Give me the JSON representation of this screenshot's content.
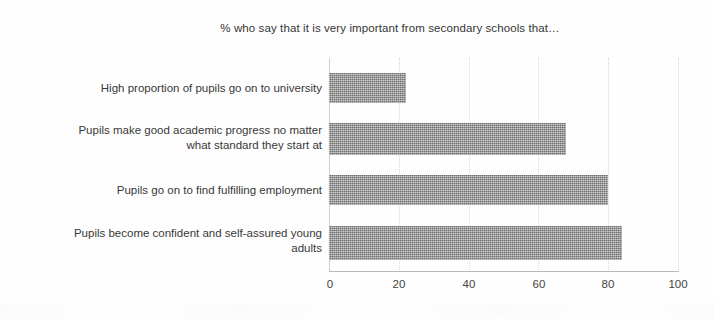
{
  "chart_data": {
    "type": "bar",
    "orientation": "horizontal",
    "title": "% who say that it is very important from secondary schools that…",
    "xlabel": "",
    "ylabel": "",
    "xlim": [
      0,
      100
    ],
    "xticks": [
      0,
      20,
      40,
      60,
      80,
      100
    ],
    "tick_labels": [
      "0",
      "20",
      "40",
      "60",
      "80",
      "100"
    ],
    "grid": "vertical dotted gridlines at each x tick",
    "legend": "none",
    "bar_color": "#8a8a8a",
    "categories": [
      "High proportion of pupils go on to university",
      "Pupils make good academic progress no matter what standard they start at",
      "Pupils go on to find fulfilling employment",
      "Pupils become confident and self-assured young adults"
    ],
    "values": [
      22,
      68,
      80,
      84
    ],
    "bars": [
      {
        "label": "High proportion of pupils go on to university",
        "label_lines": [
          "High proportion of pupils go on to university"
        ],
        "value": 22
      },
      {
        "label": "Pupils make good academic progress no matter what standard they start at",
        "label_lines": [
          "Pupils make good academic progress no matter",
          "what standard they start at"
        ],
        "value": 68
      },
      {
        "label": "Pupils go on to find fulfilling employment",
        "label_lines": [
          "Pupils go on to find fulfilling employment"
        ],
        "value": 80
      },
      {
        "label": "Pupils become confident and self-assured young adults",
        "label_lines": [
          "Pupils become confident and self-assured young",
          "adults"
        ],
        "value": 84
      }
    ]
  }
}
